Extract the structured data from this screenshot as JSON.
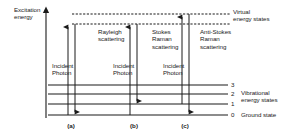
{
  "figure": {
    "axis_label": "Excitation\nenergy",
    "virtual_states_label": "Virtual\nenergy states",
    "vibrational_states_label": "Vibrational\nenergy states",
    "ground_state_label": "Ground state",
    "incident_photon_label": "Incident\nPhoton",
    "line_color": "#1a1a1a",
    "text_color": "#1a1a1a",
    "background_color": "#ffffff"
  },
  "levels": [
    {
      "number": "3",
      "y": 85
    },
    {
      "number": "2",
      "y": 94
    },
    {
      "number": "1",
      "y": 104
    },
    {
      "number": "0",
      "y": 115
    }
  ],
  "virtual_lines": [
    {
      "name": "upper-virtual-line",
      "y": 14
    },
    {
      "name": "lower-virtual-line",
      "y": 24
    }
  ],
  "processes": [
    {
      "key": "a",
      "panel_label": "(a)",
      "name": "Rayleigh scattering",
      "caption": "Rayleigh\nscattering",
      "incident_label": "Incident\nPhoton",
      "up_arrow": {
        "x": 68,
        "from_y": 115,
        "to_y": 24
      },
      "down_arrow": {
        "x": 75,
        "from_y": 24,
        "to_y": 115
      },
      "panel_x": 71
    },
    {
      "key": "b",
      "panel_label": "(b)",
      "name": "Stokes Raman scattering",
      "caption": "Stokes\nRaman\nscattering",
      "incident_label": "Incident\nPhoton",
      "up_arrow": {
        "x": 130,
        "from_y": 115,
        "to_y": 24
      },
      "down_arrow": {
        "x": 137,
        "from_y": 24,
        "to_y": 104
      },
      "panel_x": 134
    },
    {
      "key": "c",
      "panel_label": "(c)",
      "name": "Anti-Stokes Raman scattering",
      "caption": "Anti-Stokes\nRaman\nscattering",
      "incident_label": "Incident\nPhoton",
      "up_arrow": {
        "x": 182,
        "from_y": 104,
        "to_y": 14
      },
      "down_arrow": {
        "x": 189,
        "from_y": 14,
        "to_y": 115
      },
      "panel_x": 185
    }
  ],
  "geometry": {
    "axis_x": 46,
    "axis_top_y": 8,
    "axis_bottom_y": 118,
    "level_line_x1": 48,
    "level_line_x2": 228,
    "virtual_line_x1": 72,
    "virtual_line_x2": 230
  }
}
